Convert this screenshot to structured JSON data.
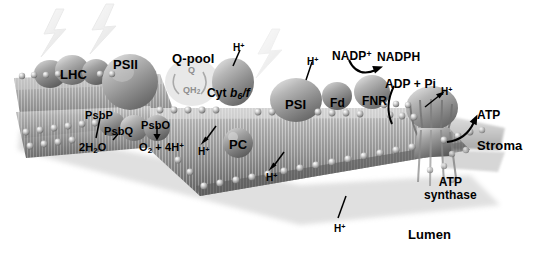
{
  "figure": {
    "style": "grayscale 3D rendered biological illustration",
    "background_color": "#ffffff",
    "text_color": "#000000"
  },
  "compartments": [
    {
      "name": "stroma",
      "label": "Stroma",
      "x": 477,
      "y": 139
    },
    {
      "name": "lumen",
      "label": "Lumen",
      "x": 408,
      "y": 228
    }
  ],
  "complexes": [
    {
      "id": "lhc",
      "label": "LHC",
      "x": 60,
      "y": 68
    },
    {
      "id": "psii",
      "label": "PSII",
      "x": 113,
      "y": 58
    },
    {
      "id": "psbp",
      "label": "PsbP",
      "x": 85,
      "y": 110
    },
    {
      "id": "psbq",
      "label": "PsbQ",
      "x": 104,
      "y": 126
    },
    {
      "id": "psbo",
      "label": "PsbO",
      "x": 141,
      "y": 120
    },
    {
      "id": "qpool",
      "label": "Q-pool",
      "x": 172,
      "y": 52
    },
    {
      "id": "cytb6f",
      "label_prefix": "Cyt ",
      "label_italic": "b",
      "label_sub": "6",
      "label_suffix": "/f",
      "x": 207,
      "y": 87
    },
    {
      "id": "pc",
      "label": "PC",
      "x": 229,
      "y": 138
    },
    {
      "id": "psi",
      "label": "PSI",
      "x": 285,
      "y": 98
    },
    {
      "id": "fd",
      "label": "Fd",
      "x": 330,
      "y": 97
    },
    {
      "id": "fnr",
      "label": "FNR",
      "x": 362,
      "y": 95
    },
    {
      "id": "atp_synthase",
      "label_line1": "ATP",
      "label_line2": "synthase",
      "x": 424,
      "y": 176
    }
  ],
  "qpool_cycle": [
    {
      "id": "q",
      "label": "Q",
      "x": 188,
      "y": 66
    },
    {
      "id": "qh2",
      "label": "QH",
      "sub": "2",
      "x": 183,
      "y": 86
    }
  ],
  "substrates": [
    {
      "id": "water",
      "prefix": "2H",
      "sub": "2",
      "suffix": "O",
      "x": 79,
      "y": 142
    },
    {
      "id": "oxygen",
      "prefix": "O",
      "sub": "2",
      "suffix": " + 4H",
      "sup": "+",
      "x": 139,
      "y": 142
    },
    {
      "id": "nadp_plus",
      "label": "NADP",
      "sup": "+",
      "x": 332,
      "y": 50
    },
    {
      "id": "nadph",
      "label": "NADPH",
      "x": 377,
      "y": 51
    },
    {
      "id": "adp_pi",
      "label": "ADP + Pi",
      "x": 385,
      "y": 78
    },
    {
      "id": "atp",
      "label": "ATP",
      "x": 477,
      "y": 109
    }
  ],
  "protons": [
    {
      "id": "h-cytb6f-stroma",
      "label": "H",
      "sup": "+",
      "x": 233,
      "y": 42
    },
    {
      "id": "h-psi-stroma",
      "label": "H",
      "sup": "+",
      "x": 307,
      "y": 56
    },
    {
      "id": "h-atpsynth",
      "label": "H",
      "sup": "+",
      "x": 441,
      "y": 86
    },
    {
      "id": "h-lumen-cytb6f",
      "label": "H",
      "sup": "+",
      "x": 198,
      "y": 146
    },
    {
      "id": "h-lumen-psi",
      "label": "H",
      "sup": "+",
      "x": 266,
      "y": 172
    },
    {
      "id": "h-lumen-center",
      "label": "H",
      "sup": "+",
      "x": 334,
      "y": 223
    }
  ],
  "photons": [
    {
      "id": "photon-lhc",
      "x": 38,
      "y": 8,
      "target": "lhc"
    },
    {
      "id": "photon-psii",
      "x": 88,
      "y": 3,
      "target": "psii"
    },
    {
      "id": "photon-psi",
      "x": 253,
      "y": 28,
      "target": "psi"
    }
  ],
  "arrows": [
    {
      "id": "arrow-psbp-to-water",
      "from": "PsbP",
      "to": "2H2O"
    },
    {
      "id": "arrow-psbo-to-oxygen",
      "from": "PsbO",
      "to": "O2 + 4H+"
    },
    {
      "id": "arrow-proton-to-lumen",
      "from": "membrane",
      "to": "H+ lumen"
    },
    {
      "id": "arrow-nadp-to-nadph",
      "from": "NADP+",
      "to": "NADPH"
    },
    {
      "id": "arrow-adp-to-synthase",
      "from": "ADP + Pi",
      "to": "ATP synthase"
    },
    {
      "id": "arrow-synthase-to-atp",
      "from": "ATP synthase",
      "to": "ATP"
    },
    {
      "id": "arrow-h-into-synthase",
      "from": "H+",
      "to": "ATP synthase"
    }
  ]
}
